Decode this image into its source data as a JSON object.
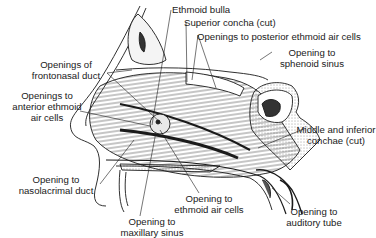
{
  "diagram": {
    "type": "anatomical-illustration",
    "labels": [
      {
        "id": "ethmoid-bulla",
        "lines": [
          "Ethmoid bulla"
        ],
        "x": 172,
        "y": 4,
        "align": "l"
      },
      {
        "id": "superior-concha",
        "lines": [
          "Superior concha (cut)"
        ],
        "x": 184,
        "y": 16,
        "align": "l"
      },
      {
        "id": "openings-posterior-ethmoid",
        "lines": [
          "Openings to posterior ethmoid air cells"
        ],
        "x": 197,
        "y": 30,
        "align": "l"
      },
      {
        "id": "opening-sphenoid",
        "lines": [
          "Opening to",
          "sphenoid sinus"
        ],
        "x": 276,
        "y": 47,
        "align": "c"
      },
      {
        "id": "middle-inferior-conchae",
        "lines": [
          "Middle and inferior",
          "conchae (cut)"
        ],
        "x": 307,
        "y": 123,
        "align": "c"
      },
      {
        "id": "openings-frontonasal",
        "lines": [
          "Openings of",
          "frontonasal duct"
        ],
        "x": 36,
        "y": 58,
        "align": "r"
      },
      {
        "id": "openings-anterior-ethmoid",
        "lines": [
          "Openings to",
          "anterior ethmoid",
          "air cells"
        ],
        "x": 14,
        "y": 90,
        "align": "r"
      },
      {
        "id": "opening-nasolacrimal",
        "lines": [
          "Opening to",
          "nasolacrimal duct"
        ],
        "x": 16,
        "y": 172,
        "align": "c"
      },
      {
        "id": "opening-ethmoid-air-cells",
        "lines": [
          "Opening to",
          "ethmoid air cells"
        ],
        "x": 176,
        "y": 193,
        "align": "c"
      },
      {
        "id": "opening-auditory-tube",
        "lines": [
          "Opening to",
          "auditory tube"
        ],
        "x": 280,
        "y": 204,
        "align": "c"
      },
      {
        "id": "opening-maxillary",
        "lines": [
          "Opening to",
          "maxillary sinus"
        ],
        "x": 116,
        "y": 216,
        "align": "c"
      }
    ],
    "colors": {
      "ink": "#1a1a1a",
      "background": "#ffffff",
      "shade": "#8a8a8a"
    }
  }
}
